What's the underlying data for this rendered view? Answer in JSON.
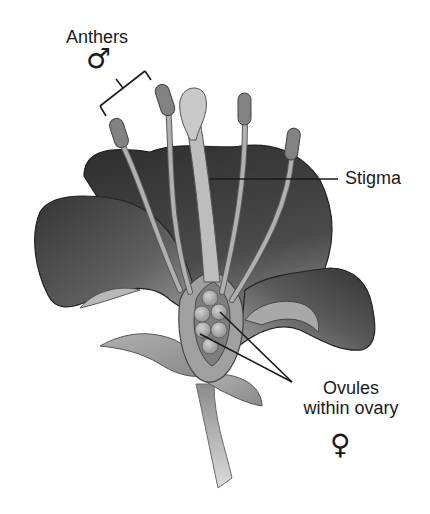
{
  "diagram": {
    "labels": {
      "anthers": "Anthers",
      "male_symbol": "♂",
      "stigma": "Stigma",
      "ovules_line1": "Ovules",
      "ovules_line2": "within ovary",
      "female_symbol": "♀"
    },
    "colors": {
      "petal_dark": "#3a3a3a",
      "petal_mid": "#7a7a7a",
      "petal_light": "#b5b5b5",
      "anther": "#808080",
      "stigma": "#c8c8c8",
      "filament": "#a8a8a8",
      "outline": "#2a2a2a",
      "leader_line": "#1a1a1a"
    }
  }
}
